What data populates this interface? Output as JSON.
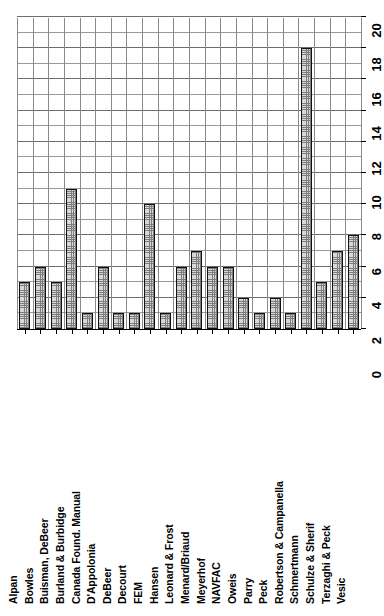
{
  "chart_data": {
    "type": "bar",
    "orientation": "vertical-rotated-90",
    "title": "",
    "subtitle": "",
    "xlabel": "",
    "ylabel": "",
    "ylim": [
      0,
      20
    ],
    "ytick_step": 2,
    "minor_ticks": true,
    "grid": true,
    "legend": null,
    "tick_labels": [
      "0",
      "2",
      "4",
      "6",
      "8",
      "10",
      "12",
      "14",
      "16",
      "18",
      "20"
    ],
    "tick_values": [
      0,
      2,
      4,
      6,
      8,
      10,
      12,
      14,
      16,
      18,
      20
    ],
    "categories": [
      "Alpan",
      "Bowles",
      "Buisman, DeBeer",
      "Burland & Burbidge",
      "Canada Found. Manual",
      "D'Appolonia",
      "DeBeer",
      "Decourt",
      "FEM",
      "Hansen",
      "Leonard & Frost",
      "Menard/Briaud",
      "Meyerhof",
      "NAVFAC",
      "Oweis",
      "Parry",
      "Peck",
      "Robertson & Campanella",
      "Schmertmann",
      "Schulze & Sherif",
      "Terzaghi & Peck",
      "Vesic"
    ],
    "values": [
      3,
      4,
      3,
      9,
      1,
      4,
      1,
      1,
      8,
      1,
      4,
      5,
      4,
      4,
      2,
      1,
      2,
      1,
      18,
      3,
      5,
      6
    ]
  },
  "style": {
    "bar_fill": "#d8d8d8",
    "bar_edge": "#111111",
    "grid_color": "#6d6d6d",
    "minor_grid_color": "#9a9a9a",
    "axis_color": "#000000",
    "background": "#ffffff"
  }
}
